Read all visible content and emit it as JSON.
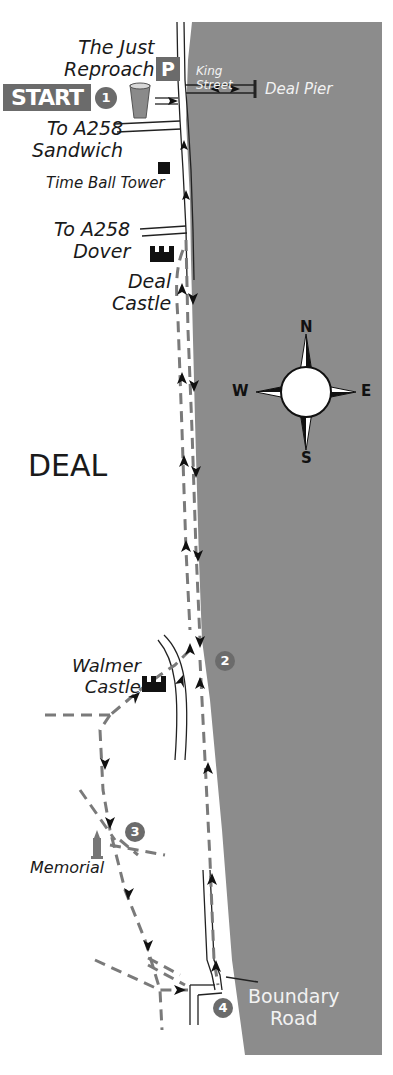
{
  "map": {
    "town_label": "DEAL",
    "colors": {
      "sea": "#8c8c8c",
      "route": "#7a7a7a",
      "road": "#222222",
      "badge": "#6b6b6b",
      "land": "#ffffff"
    }
  },
  "start": {
    "label": "START",
    "step": "1"
  },
  "pub": {
    "label_line1": "The Just",
    "label_line2": "Reproach"
  },
  "parking": {
    "label": "P"
  },
  "streets": {
    "king_street_line1": "King",
    "king_street_line2": "Street",
    "a258_sandwich_line1": "To A258",
    "a258_sandwich_line2": "Sandwich",
    "a258_dover_line1": "To A258",
    "a258_dover_line2": "Dover",
    "boundary_road_line1": "Boundary",
    "boundary_road_line2": "Road"
  },
  "landmarks": {
    "deal_pier": "Deal Pier",
    "time_ball_tower": "Time Ball Tower",
    "deal_castle_line1": "Deal",
    "deal_castle_line2": "Castle",
    "walmer_castle_line1": "Walmer",
    "walmer_castle_line2": "Castle",
    "memorial": "Memorial"
  },
  "waypoints": [
    {
      "step": "2"
    },
    {
      "step": "3"
    },
    {
      "step": "4"
    }
  ],
  "compass": {
    "north": "N",
    "south": "S",
    "east": "E",
    "west": "W"
  }
}
